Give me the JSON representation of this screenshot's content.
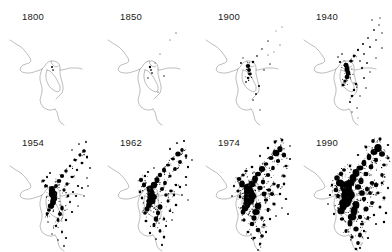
{
  "figure": {
    "background_color": "#ffffff",
    "coastline_color": "#6e6e6e",
    "urban_color": "#000000",
    "label_color": "#1a1a1a",
    "rows": 2,
    "columns": 4,
    "panel_count": 8
  },
  "panels": [
    {
      "label": "1800",
      "year": 1800,
      "row": 1,
      "column": 1,
      "urban_extent": "minimal"
    },
    {
      "label": "1850",
      "year": 1850,
      "row": 1,
      "column": 2,
      "urban_extent": "very small"
    },
    {
      "label": "1900",
      "year": 1900,
      "row": 1,
      "column": 3,
      "urban_extent": "small"
    },
    {
      "label": "1940",
      "year": 1940,
      "row": 1,
      "column": 4,
      "urban_extent": "moderate"
    },
    {
      "label": "1954",
      "year": 1954,
      "row": 2,
      "column": 1,
      "urban_extent": "large"
    },
    {
      "label": "1962",
      "year": 1962,
      "row": 2,
      "column": 2,
      "urban_extent": "larger"
    },
    {
      "label": "1974",
      "year": 1974,
      "row": 2,
      "column": 3,
      "urban_extent": "extensive"
    },
    {
      "label": "1990",
      "year": 1990,
      "row": 2,
      "column": 4,
      "urban_extent": "most extensive"
    }
  ],
  "chart_data": {
    "type": "map",
    "xlabel": "",
    "ylabel": "",
    "categories": [
      "1800",
      "1850",
      "1900",
      "1940",
      "1954",
      "1962",
      "1974",
      "1990"
    ],
    "series": [
      {
        "name": "Relative urbanized area",
        "values": [
          1,
          2,
          5,
          14,
          34,
          50,
          76,
          100
        ]
      }
    ],
    "legend_position": "none",
    "grid": false
  }
}
